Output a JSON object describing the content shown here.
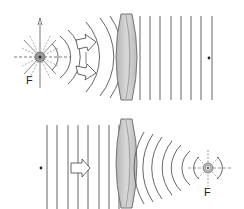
{
  "diagram": {
    "type": "physics-optics",
    "colors": {
      "line": "#555555",
      "lens_fill": "#c8c8c8",
      "lens_edge": "#6a6a6a",
      "arrow_fill": "#ffffff",
      "arrow_edge": "#555555"
    },
    "panels": [
      {
        "id": "top",
        "focus_label": "F",
        "source": "point source at focus emitting spherical wavefronts",
        "lens": "biconvex",
        "output": "plane wavefronts",
        "arrows": 2,
        "plane_wave_lines": 8,
        "marker": "dot"
      },
      {
        "id": "bottom",
        "focus_label": "F",
        "input": "plane wavefronts",
        "lens": "biconvex",
        "output": "converging spherical wavefronts to focus",
        "arrows": 1,
        "plane_wave_lines": 8,
        "marker": "dot"
      }
    ]
  }
}
